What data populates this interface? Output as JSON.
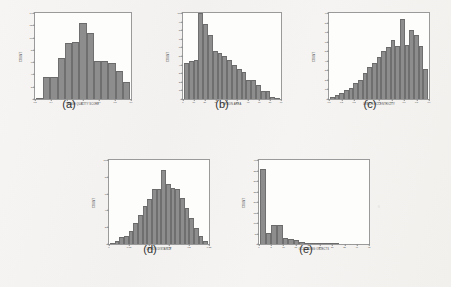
{
  "figure": {
    "background_color": "#f4f3f1",
    "bar_color": "#8d8d8d",
    "axis_color": "#9a9a9a",
    "panels": [
      {
        "caption": "(a)",
        "chart_data": {
          "type": "bar",
          "title": "",
          "xlabel": "IMAGE QUALITY SCORE",
          "ylabel": "COUNT",
          "grid": false,
          "legend": "none",
          "xlim": [
            0.25,
            0.95
          ],
          "ylim": [
            0,
            140
          ],
          "xticks": [
            "0.3",
            "0.4",
            "0.5",
            "0.6",
            "0.7",
            "0.8",
            "0.9"
          ],
          "yticks": [
            "0",
            "20",
            "40",
            "60",
            "80",
            "100",
            "120",
            "140"
          ],
          "categories": [
            "0.30",
            "0.35",
            "0.40",
            "0.45",
            "0.50",
            "0.55",
            "0.60",
            "0.65",
            "0.70",
            "0.75",
            "0.80",
            "0.85",
            "0.90"
          ],
          "values": [
            2,
            36,
            36,
            66,
            92,
            93,
            124,
            107,
            62,
            62,
            59,
            45,
            27
          ]
        }
      },
      {
        "caption": "(b)",
        "chart_data": {
          "type": "bar",
          "title": "",
          "xlabel": "LESION AREA",
          "ylabel": "COUNT",
          "grid": false,
          "legend": "none",
          "xlim": [
            0,
            90
          ],
          "ylim": [
            0,
            100
          ],
          "xticks": [
            "0",
            "10",
            "20",
            "30",
            "40",
            "50",
            "60",
            "70",
            "80",
            "90"
          ],
          "yticks": [
            "0",
            "10",
            "20",
            "30",
            "40",
            "50",
            "60",
            "70",
            "80",
            "90",
            "100"
          ],
          "categories": [
            "2",
            "6",
            "10",
            "14",
            "18",
            "22",
            "26",
            "30",
            "34",
            "38",
            "42",
            "46",
            "50",
            "54",
            "58",
            "62",
            "66",
            "70",
            "74",
            "78"
          ],
          "values": [
            42,
            44,
            45,
            100,
            87,
            74,
            56,
            53,
            50,
            45,
            39,
            35,
            31,
            22,
            22,
            16,
            9,
            9,
            2,
            1
          ]
        }
      },
      {
        "caption": "(c)",
        "chart_data": {
          "type": "bar",
          "title": "",
          "xlabel": "LESION ECCENTRICITY",
          "ylabel": "COUNT",
          "grid": false,
          "legend": "none",
          "xlim": [
            0.05,
            0.95
          ],
          "ylim": [
            0,
            90
          ],
          "xticks": [
            "0.1",
            "0.2",
            "0.3",
            "0.4",
            "0.5",
            "0.6",
            "0.7",
            "0.8",
            "0.9"
          ],
          "yticks": [
            "0",
            "10",
            "20",
            "30",
            "40",
            "50",
            "60",
            "70",
            "80",
            "90"
          ],
          "categories": [
            "0.10",
            "0.14",
            "0.18",
            "0.22",
            "0.26",
            "0.30",
            "0.34",
            "0.38",
            "0.42",
            "0.46",
            "0.50",
            "0.54",
            "0.58",
            "0.62",
            "0.66",
            "0.70",
            "0.74",
            "0.78",
            "0.82",
            "0.86",
            "0.90"
          ],
          "values": [
            2,
            4,
            6,
            9,
            12,
            17,
            20,
            27,
            33,
            38,
            44,
            50,
            54,
            62,
            55,
            84,
            57,
            72,
            67,
            55,
            31
          ]
        }
      },
      {
        "caption": "(d)",
        "chart_data": {
          "type": "bar",
          "title": "",
          "xlabel": "LESION DISTANCE",
          "ylabel": "COUNT",
          "grid": false,
          "legend": "none",
          "xlim": [
            0,
            0.25
          ],
          "ylim": [
            0,
            100
          ],
          "xticks": [
            "0",
            "0.05",
            "0.1",
            "0.15",
            "0.2",
            "0.25"
          ],
          "yticks": [
            "0",
            "20",
            "40",
            "60",
            "80",
            "100"
          ],
          "categories": [
            "0.010",
            "0.020",
            "0.030",
            "0.040",
            "0.050",
            "0.060",
            "0.070",
            "0.080",
            "0.090",
            "0.100",
            "0.110",
            "0.120",
            "0.130",
            "0.140",
            "0.150",
            "0.160",
            "0.170",
            "0.180",
            "0.190",
            "0.200",
            "0.210"
          ],
          "values": [
            1,
            3,
            8,
            9,
            16,
            25,
            34,
            45,
            54,
            66,
            65,
            88,
            71,
            67,
            66,
            55,
            43,
            31,
            19,
            9,
            3
          ]
        }
      },
      {
        "caption": "(e)",
        "chart_data": {
          "type": "bar",
          "title": "",
          "xlabel": "OCCLUDING OBJECTS",
          "ylabel": "COUNT",
          "grid": false,
          "legend": "none",
          "xlim": [
            0,
            45
          ],
          "ylim": [
            0,
            400
          ],
          "xticks": [
            "0",
            "5",
            "10",
            "15",
            "20",
            "25",
            "30",
            "35",
            "40",
            "45"
          ],
          "yticks": [
            "0",
            "50",
            "100",
            "150",
            "200",
            "250",
            "300",
            "350",
            "400"
          ],
          "categories": [
            "1",
            "3",
            "5",
            "7",
            "9",
            "11",
            "13",
            "15",
            "17",
            "19",
            "21",
            "23",
            "25",
            "27",
            "29",
            "31",
            "33",
            "35",
            "37",
            "39",
            "41",
            "43"
          ],
          "values": [
            355,
            52,
            89,
            89,
            31,
            24,
            19,
            11,
            7,
            5,
            4,
            2,
            1,
            1,
            0,
            0,
            0,
            0,
            0,
            0,
            0,
            0
          ]
        }
      }
    ]
  }
}
